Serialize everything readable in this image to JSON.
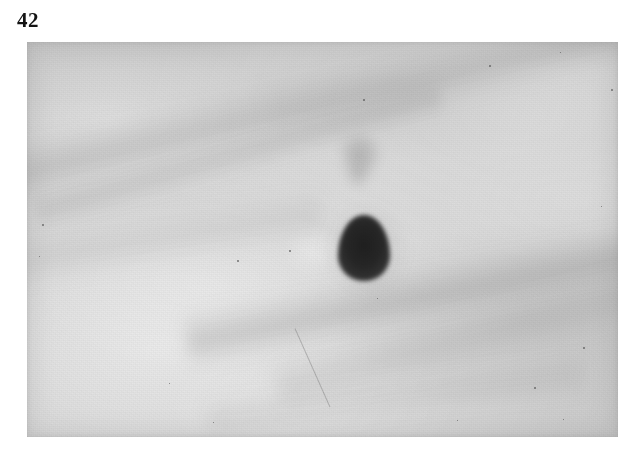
{
  "page": {
    "background_color": "#ffffff",
    "width": 640,
    "height": 463
  },
  "figure": {
    "number_label": "42",
    "caption": "",
    "plate": {
      "name": "grayscale-photographic-plate",
      "left": 27,
      "top": 42,
      "width": 591,
      "height": 395,
      "background_color": "#cdcdcd",
      "description": "Light gray grainy photographic plate",
      "features": [
        {
          "name": "main-dark-spot",
          "shape": "oval",
          "center_x": 337,
          "center_y": 206,
          "width": 52,
          "height": 66,
          "color": "#222222",
          "intensity": "dark"
        },
        {
          "name": "faint-secondary-spot",
          "shape": "irregular",
          "center_x": 333,
          "center_y": 113,
          "width": 46,
          "height": 50,
          "color": "#6e6e6e",
          "intensity": "faint"
        },
        {
          "name": "upper-diagonal-streak",
          "shape": "band",
          "angle_deg": -13,
          "color": "#828282",
          "intensity": "faint"
        },
        {
          "name": "lower-diagonal-streak",
          "shape": "band",
          "angle_deg": -11,
          "color": "#7a7a7a",
          "intensity": "faint"
        }
      ],
      "specks": [
        {
          "x": 462,
          "y": 23,
          "size": 2
        },
        {
          "x": 336,
          "y": 57,
          "size": 2
        },
        {
          "x": 533,
          "y": 10,
          "size": 1
        },
        {
          "x": 584,
          "y": 47,
          "size": 2
        },
        {
          "x": 262,
          "y": 208,
          "size": 2
        },
        {
          "x": 210,
          "y": 218,
          "size": 2
        },
        {
          "x": 15,
          "y": 182,
          "size": 2
        },
        {
          "x": 12,
          "y": 214,
          "size": 1
        },
        {
          "x": 556,
          "y": 305,
          "size": 2
        },
        {
          "x": 507,
          "y": 345,
          "size": 2
        },
        {
          "x": 430,
          "y": 378,
          "size": 1
        },
        {
          "x": 186,
          "y": 380,
          "size": 1
        },
        {
          "x": 536,
          "y": 377,
          "size": 1
        },
        {
          "x": 142,
          "y": 341,
          "size": 1
        },
        {
          "x": 350,
          "y": 256,
          "size": 1
        },
        {
          "x": 574,
          "y": 164,
          "size": 1
        }
      ]
    }
  }
}
